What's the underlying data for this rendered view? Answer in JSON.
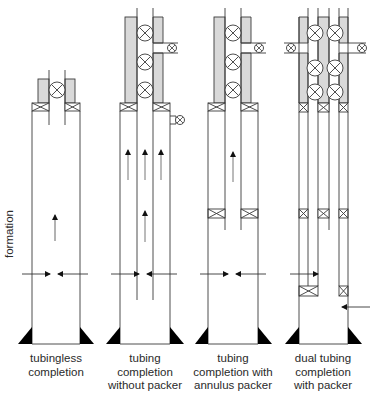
{
  "diagram": {
    "side_label": "formation",
    "colors": {
      "line": "#3a3a3a",
      "cement": "#d9d9d9",
      "arrow": "#111111",
      "triangle": "#000000",
      "background": "#ffffff"
    },
    "completions": [
      {
        "id": "tubingless",
        "caption": "tubingless\ncompletion"
      },
      {
        "id": "tubing-without-packer",
        "caption": "tubing\ncompletion\nwithout packer"
      },
      {
        "id": "tubing-with-annulus-packer",
        "caption": "tubing\ncompletion with\nannulus packer"
      },
      {
        "id": "dual-tubing-with-packer",
        "caption": "dual tubing\ncompletion\nwith packer"
      }
    ],
    "icons": [
      "valve-icon",
      "packer-icon",
      "flow-arrow-icon",
      "casing-shoe-icon"
    ]
  }
}
